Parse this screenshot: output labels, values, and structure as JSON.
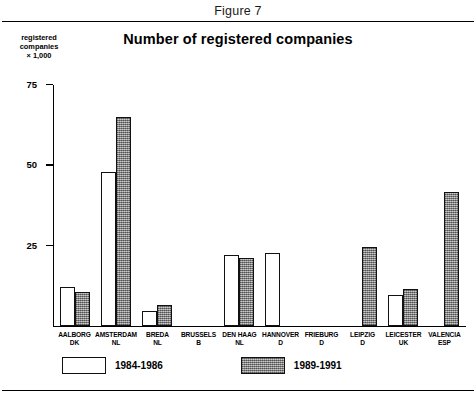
{
  "figure": {
    "caption": "Figure 7"
  },
  "chart_data": {
    "type": "bar",
    "title": "Number of registered companies",
    "xlabel": "",
    "ylabel": "registered companies × 1,000",
    "ylabel_lines": [
      "registered",
      "companies",
      "× 1,000"
    ],
    "ylim": [
      0,
      75
    ],
    "yticks": [
      25,
      50,
      75
    ],
    "ytick_labels": [
      "25",
      "50",
      "75"
    ],
    "grid": false,
    "legend_position": "bottom-left",
    "categories": [
      "AALBORG\nDK",
      "AMSTERDAM\nNL",
      "BREDA\nNL",
      "BRUSSELS\nB",
      "DEN HAAG\nNL",
      "HANNOVER\nD",
      "FRIEBURG\nD",
      "LEIPZIG\nD",
      "LEICESTER\nUK",
      "VALENCIA\nESP"
    ],
    "category_cities": [
      "AALBORG",
      "AMSTERDAM",
      "BREDA",
      "BRUSSELS",
      "DEN HAAG",
      "HANNOVER",
      "FRIEBURG",
      "LEIPZIG",
      "LEICESTER",
      "VALENCIA"
    ],
    "category_countries": [
      "DK",
      "NL",
      "NL",
      "B",
      "NL",
      "D",
      "D",
      "D",
      "UK",
      "ESP"
    ],
    "series": [
      {
        "name": "1984-1986",
        "values": [
          12,
          48,
          4.5,
          0,
          22,
          22.5,
          0,
          0,
          9.5,
          0
        ]
      },
      {
        "name": "1989-1991",
        "values": [
          10.5,
          65,
          6.5,
          0,
          21,
          0,
          0,
          24.5,
          11.5,
          41.5
        ]
      }
    ]
  }
}
